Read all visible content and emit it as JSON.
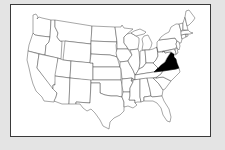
{
  "map": {
    "title": "United States map",
    "highlighted_state": "Virginia",
    "highlight_color": "#000000",
    "state_fill": "#ffffff",
    "border_color": "#3c3c3c",
    "background_color": "#e4e4e4",
    "states": [
      "Washington",
      "Oregon",
      "California",
      "Idaho",
      "Nevada",
      "Montana",
      "Wyoming",
      "Utah",
      "Arizona",
      "Colorado",
      "New Mexico",
      "North Dakota",
      "South Dakota",
      "Nebraska",
      "Kansas",
      "Oklahoma",
      "Texas",
      "Minnesota",
      "Iowa",
      "Missouri",
      "Arkansas",
      "Louisiana",
      "Wisconsin",
      "Illinois",
      "Michigan",
      "Indiana",
      "Ohio",
      "Kentucky",
      "Tennessee",
      "Mississippi",
      "Alabama",
      "Georgia",
      "Florida",
      "South Carolina",
      "North Carolina",
      "Virginia",
      "West Virginia",
      "Pennsylvania",
      "New York",
      "Maryland",
      "Delaware",
      "New Jersey",
      "Connecticut",
      "Rhode Island",
      "Massachusetts",
      "Vermont",
      "New Hampshire",
      "Maine"
    ]
  }
}
